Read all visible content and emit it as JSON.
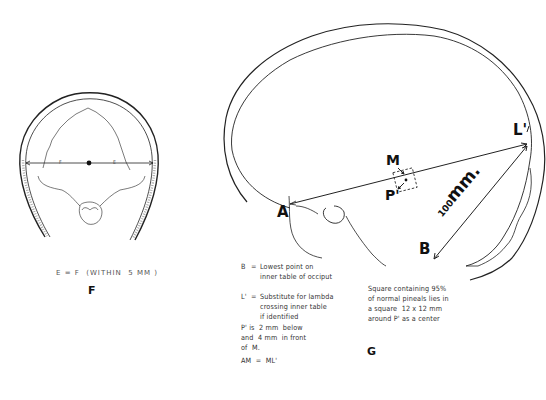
{
  "panel_f": {
    "label": "F",
    "caption": "E = F  (WITHIN  5 MM )",
    "segment_labels": {
      "left": "F",
      "right": "E"
    }
  },
  "panel_g": {
    "label": "G",
    "points": {
      "A": "A",
      "B": "B",
      "L": "L'",
      "M": "M",
      "P": "P'"
    },
    "measure": {
      "value": "100",
      "unit": "mm."
    },
    "legend": [
      {
        "key": "B",
        "sep": "=",
        "line1": "Lowest point on",
        "line2": "inner table of occiput"
      },
      {
        "key": "L'",
        "sep": "=",
        "line1": "Substitute for lambda",
        "line2": "crossing inner table",
        "line3": "if identified"
      }
    ],
    "note_p": {
      "line1": "P' is  2 mm  below",
      "line2": "and  4 mm  in front",
      "line3": "of  M."
    },
    "note_am": "AM  =  ML'",
    "square_note": {
      "line1": "Square containing 95%",
      "line2": "of normal pineals lies in",
      "line3": "a square  12 x 12 mm",
      "line4": "around P' as a center"
    }
  }
}
